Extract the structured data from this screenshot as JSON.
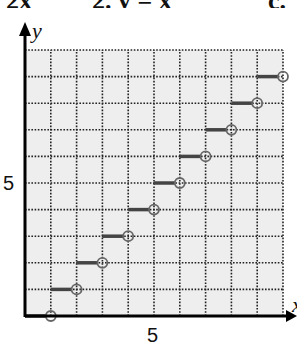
{
  "header_fragment": {
    "pieces": [
      "2x",
      "2. y = x",
      "c."
    ]
  },
  "chart_data": {
    "type": "line",
    "subtype": "step-function (floor)",
    "title": "",
    "xlabel": "x",
    "ylabel": "y",
    "xlim": [
      0,
      10
    ],
    "ylim": [
      0,
      10
    ],
    "grid": true,
    "grid_style": "dotted",
    "x_ticks_labeled": [
      5
    ],
    "y_ticks_labeled": [
      5
    ],
    "tick_labels": {
      "x": "5",
      "y": "5"
    },
    "segments": [
      {
        "x0": 0,
        "x1": 1,
        "y": 0,
        "closed_left": true,
        "open_right": true
      },
      {
        "x0": 1,
        "x1": 2,
        "y": 1,
        "closed_left": true,
        "open_right": true
      },
      {
        "x0": 2,
        "x1": 3,
        "y": 2,
        "closed_left": true,
        "open_right": true
      },
      {
        "x0": 3,
        "x1": 4,
        "y": 3,
        "closed_left": true,
        "open_right": true
      },
      {
        "x0": 4,
        "x1": 5,
        "y": 4,
        "closed_left": true,
        "open_right": true
      },
      {
        "x0": 5,
        "x1": 6,
        "y": 5,
        "closed_left": true,
        "open_right": true
      },
      {
        "x0": 6,
        "x1": 7,
        "y": 6,
        "closed_left": true,
        "open_right": true
      },
      {
        "x0": 7,
        "x1": 8,
        "y": 7,
        "closed_left": true,
        "open_right": true
      },
      {
        "x0": 8,
        "x1": 9,
        "y": 8,
        "closed_left": true,
        "open_right": true
      },
      {
        "x0": 9,
        "x1": 10,
        "y": 9,
        "closed_left": true,
        "open_right": true
      }
    ],
    "open_circles": [
      [
        1,
        0
      ],
      [
        2,
        1
      ],
      [
        3,
        2
      ],
      [
        4,
        3
      ],
      [
        5,
        4
      ],
      [
        6,
        5
      ],
      [
        7,
        6
      ],
      [
        8,
        7
      ],
      [
        9,
        8
      ],
      [
        10,
        9
      ]
    ],
    "colors": {
      "grid_fill": "#eeeeee",
      "grid_line": "#222222",
      "step_line": "#444444",
      "circle": "#666666",
      "axis": "#000000"
    }
  }
}
